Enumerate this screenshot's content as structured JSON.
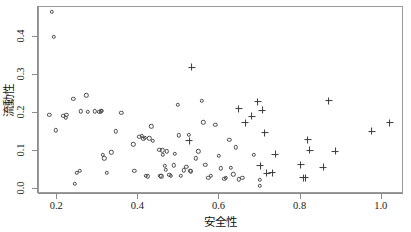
{
  "chart_data": {
    "type": "scatter",
    "title": "",
    "xlabel": "安全性",
    "ylabel": "流動性",
    "xlim": [
      0.155,
      1.055
    ],
    "ylim": [
      -0.012,
      0.478
    ],
    "grid": false,
    "legend": "none",
    "xticks": [
      0.2,
      0.4,
      0.6,
      0.8,
      1.0
    ],
    "xtick_labels": [
      "0.2",
      "0.4",
      "0.6",
      "0.8",
      "1.0"
    ],
    "yticks": [
      0.0,
      0.1,
      0.2,
      0.3,
      0.4
    ],
    "ytick_labels": [
      "0.0",
      "0.1",
      "0.2",
      "0.3",
      "0.4"
    ],
    "series": [
      {
        "name": "circle-group",
        "marker": "circle",
        "color": "#4a4a4a",
        "points": [
          [
            0.187,
            0.465
          ],
          [
            0.192,
            0.4
          ],
          [
            0.18,
            0.196
          ],
          [
            0.196,
            0.155
          ],
          [
            0.215,
            0.193
          ],
          [
            0.222,
            0.196
          ],
          [
            0.221,
            0.188
          ],
          [
            0.24,
            0.238
          ],
          [
            0.243,
            0.014
          ],
          [
            0.248,
            0.044
          ],
          [
            0.256,
            0.049
          ],
          [
            0.258,
            0.205
          ],
          [
            0.272,
            0.247
          ],
          [
            0.276,
            0.203
          ],
          [
            0.292,
            0.205
          ],
          [
            0.304,
            0.204
          ],
          [
            0.307,
            0.205
          ],
          [
            0.31,
            0.206
          ],
          [
            0.312,
            0.09
          ],
          [
            0.316,
            0.082
          ],
          [
            0.322,
            0.044
          ],
          [
            0.333,
            0.097
          ],
          [
            0.345,
            0.152
          ],
          [
            0.358,
            0.201
          ],
          [
            0.388,
            0.118
          ],
          [
            0.39,
            0.048
          ],
          [
            0.402,
            0.138
          ],
          [
            0.409,
            0.14
          ],
          [
            0.412,
            0.132
          ],
          [
            0.416,
            0.135
          ],
          [
            0.418,
            0.035
          ],
          [
            0.424,
            0.034
          ],
          [
            0.427,
            0.134
          ],
          [
            0.432,
            0.165
          ],
          [
            0.436,
            0.127
          ],
          [
            0.452,
            0.104
          ],
          [
            0.454,
            0.035
          ],
          [
            0.457,
            0.034
          ],
          [
            0.459,
            0.103
          ],
          [
            0.461,
            0.09
          ],
          [
            0.465,
            0.062
          ],
          [
            0.468,
            0.052
          ],
          [
            0.47,
            0.1
          ],
          [
            0.476,
            0.039
          ],
          [
            0.48,
            0.036
          ],
          [
            0.487,
            0.063
          ],
          [
            0.49,
            0.094
          ],
          [
            0.497,
            0.222
          ],
          [
            0.5,
            0.142
          ],
          [
            0.505,
            0.036
          ],
          [
            0.512,
            0.05
          ],
          [
            0.518,
            0.06
          ],
          [
            0.524,
            0.143
          ],
          [
            0.528,
            0.048
          ],
          [
            0.53,
            0.047
          ],
          [
            0.541,
            0.082
          ],
          [
            0.548,
            0.1
          ],
          [
            0.556,
            0.232
          ],
          [
            0.56,
            0.176
          ],
          [
            0.565,
            0.064
          ],
          [
            0.572,
            0.03
          ],
          [
            0.578,
            0.036
          ],
          [
            0.59,
            0.169
          ],
          [
            0.598,
            0.088
          ],
          [
            0.604,
            0.055
          ],
          [
            0.612,
            0.028
          ],
          [
            0.616,
            0.03
          ],
          [
            0.624,
            0.13
          ],
          [
            0.628,
            0.056
          ],
          [
            0.634,
            0.04
          ],
          [
            0.64,
            0.11
          ],
          [
            0.648,
            0.027
          ],
          [
            0.656,
            0.03
          ],
          [
            0.684,
            0.09
          ],
          [
            0.7,
            0.01
          ],
          [
            0.7,
            0.026
          ]
        ]
      },
      {
        "name": "plus-group",
        "marker": "plus",
        "color": "#3a3a3a",
        "points": [
          [
            0.532,
            0.32
          ],
          [
            0.526,
            0.128
          ],
          [
            0.648,
            0.212
          ],
          [
            0.664,
            0.175
          ],
          [
            0.68,
            0.192
          ],
          [
            0.694,
            0.23
          ],
          [
            0.7,
            0.062
          ],
          [
            0.706,
            0.207
          ],
          [
            0.712,
            0.148
          ],
          [
            0.716,
            0.043
          ],
          [
            0.73,
            0.044
          ],
          [
            0.738,
            0.092
          ],
          [
            0.8,
            0.065
          ],
          [
            0.806,
            0.03
          ],
          [
            0.812,
            0.03
          ],
          [
            0.818,
            0.13
          ],
          [
            0.822,
            0.102
          ],
          [
            0.856,
            0.058
          ],
          [
            0.87,
            0.232
          ],
          [
            0.886,
            0.1
          ],
          [
            0.975,
            0.153
          ],
          [
            1.02,
            0.175
          ]
        ]
      }
    ]
  }
}
